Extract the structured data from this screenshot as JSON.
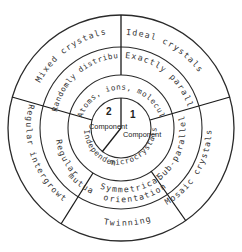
{
  "diagram": {
    "center": {
      "component1_number": "1",
      "component1_label": "Component",
      "component2_number": "2",
      "component2_label": "Component"
    },
    "ring1": {
      "top": "Atoms, ions, molecules",
      "right": "microcrystals",
      "left": "Independent"
    },
    "ring2": {
      "top_right": "Exactly parallel",
      "right": "Sub-parallel",
      "bottom_line1": "Symmetrical",
      "bottom_line2": "orientation",
      "bottom_prefix": "mutual",
      "left": "Regular",
      "top_left": "Randomly distributed"
    },
    "ring3": {
      "top_right": "Ideal crystals",
      "right": "Mosaic crystals",
      "bottom": "Twinning",
      "left": "Regular intergrowths",
      "top_left": "Mixed crystals"
    },
    "colors": {
      "line": "#1a1a1a",
      "text": "#333333",
      "background": "#ffffff"
    }
  }
}
